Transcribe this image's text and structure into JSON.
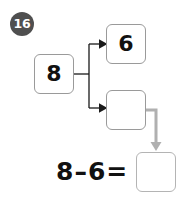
{
  "worksheet": {
    "question_number": "16",
    "type": "number-bond-subtraction",
    "whole": "8",
    "parts": [
      {
        "name": "known-part",
        "value": "6"
      },
      {
        "name": "unknown-part",
        "value": ""
      }
    ],
    "equation": {
      "minuend": "8",
      "minus_sign": "–",
      "subtrahend": "6",
      "equals_sign": "=",
      "answer": ""
    },
    "colors": {
      "badge_fill": "#4f4f4f",
      "badge_text": "#ffffff",
      "box_border": "#9a9a9a",
      "answer_box_border": "#b4b4b4",
      "arrow_black": "#1a1a1a",
      "connector_gray": "#b0b0b0",
      "text": "#111111",
      "background": "#ffffff"
    }
  }
}
